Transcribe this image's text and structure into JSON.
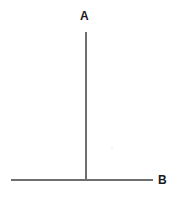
{
  "canvas": {
    "width": 175,
    "height": 198,
    "background_color": "#ffffff"
  },
  "diagram": {
    "type": "line-segments",
    "stroke_color": "#6e6e6e",
    "label_color": "#1a1a1a",
    "labels": [
      {
        "id": "a",
        "text": "A",
        "x": 85,
        "y": 16
      },
      {
        "id": "b",
        "text": "B",
        "x": 163,
        "y": 180
      }
    ],
    "segments": [
      {
        "id": "vertical",
        "label_ref": "A",
        "x1": 86,
        "y1": 32,
        "x2": 86,
        "y2": 181,
        "thickness": 2,
        "orientation": "vertical"
      },
      {
        "id": "horizontal",
        "label_ref": "B",
        "x1": 11,
        "y1": 180,
        "x2": 153,
        "y2": 180,
        "thickness": 2,
        "orientation": "horizontal"
      }
    ],
    "intersection": {
      "x": 86,
      "y": 180
    }
  }
}
